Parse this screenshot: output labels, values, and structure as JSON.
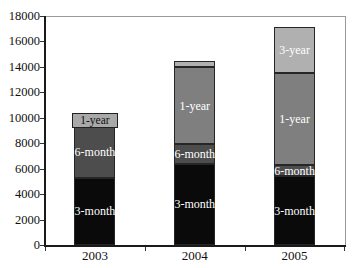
{
  "chart_data": {
    "type": "bar",
    "stacked": true,
    "title": "",
    "xlabel": "",
    "ylabel": "",
    "ylim": [
      0,
      18000
    ],
    "ytick_step": 2000,
    "grid": false,
    "legend": "none",
    "categories": [
      "2003",
      "2004",
      "2005"
    ],
    "series": [
      {
        "name": "3-month",
        "color": "#0a0a0a",
        "label_color": "#ffffff",
        "values": [
          5300,
          6400,
          5400
        ],
        "show_label": [
          true,
          true,
          true
        ],
        "boxed_label": [
          false,
          false,
          false
        ]
      },
      {
        "name": "6-month",
        "color": "#4d4d4d",
        "label_color": "#ffffff",
        "values": [
          4000,
          1500,
          900
        ],
        "show_label": [
          true,
          true,
          true
        ],
        "boxed_label": [
          false,
          false,
          false
        ]
      },
      {
        "name": "1-year",
        "color": "#7f7f7f",
        "label_color": "#ffffff",
        "values": [
          1000,
          6100,
          7200
        ],
        "show_label": [
          true,
          true,
          true
        ],
        "boxed_label": [
          true,
          false,
          false
        ]
      },
      {
        "name": "3-year",
        "color": "#b0b0b0",
        "label_color": "#ffffff",
        "values": [
          0,
          500,
          3600
        ],
        "show_label": [
          false,
          false,
          true
        ],
        "boxed_label": [
          false,
          false,
          false
        ]
      }
    ]
  },
  "layout_colors": {
    "axis": "#1a1a1a",
    "frame": "#9a9a9a",
    "tick_text": "#111111",
    "background": "#ffffff"
  }
}
